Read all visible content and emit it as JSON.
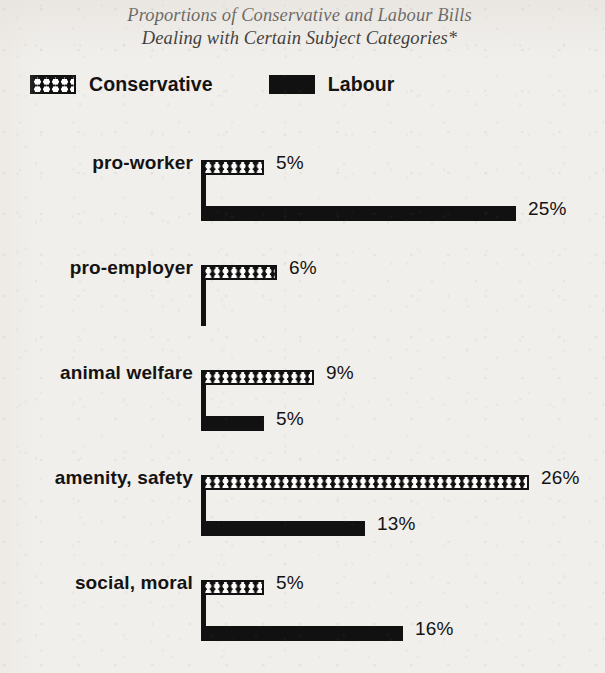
{
  "title": {
    "line1": "Proportions of Conservative and Labour Bills",
    "line2": "Dealing with Certain Subject Categories*"
  },
  "legend": {
    "conservative": "Conservative",
    "labour": "Labour"
  },
  "chart_data": {
    "type": "bar",
    "orientation": "horizontal",
    "title": "Proportions of Conservative and Labour Bills Dealing with Certain Subject Categories*",
    "xlabel": "",
    "ylabel": "",
    "xlim": [
      0,
      26
    ],
    "grid": false,
    "legend_position": "top-left",
    "value_suffix": "%",
    "categories": [
      "pro-worker",
      "pro-employer",
      "animal welfare",
      "amenity, safety",
      "social, moral"
    ],
    "series": [
      {
        "name": "Conservative",
        "color": "#111111",
        "pattern": "checkerboard",
        "values": [
          5,
          6,
          9,
          26,
          5
        ],
        "labels": [
          "5%",
          "6%",
          "9%",
          "26%",
          "5%"
        ]
      },
      {
        "name": "Labour",
        "color": "#111111",
        "pattern": "solid",
        "values": [
          25,
          0,
          5,
          13,
          16
        ],
        "labels": [
          "25%",
          "",
          "5%",
          "13%",
          "16%"
        ]
      }
    ]
  },
  "rows": [
    {
      "label": "pro-worker",
      "conservative": {
        "value": 5,
        "label": "5%"
      },
      "labour": {
        "value": 25,
        "label": "25%"
      }
    },
    {
      "label": "pro-employer",
      "conservative": {
        "value": 6,
        "label": "6%"
      },
      "labour": {
        "value": 0,
        "label": ""
      }
    },
    {
      "label": "animal welfare",
      "conservative": {
        "value": 9,
        "label": "9%"
      },
      "labour": {
        "value": 5,
        "label": "5%"
      }
    },
    {
      "label": "amenity, safety",
      "conservative": {
        "value": 26,
        "label": "26%"
      },
      "labour": {
        "value": 13,
        "label": "13%"
      }
    },
    {
      "label": "social, moral",
      "conservative": {
        "value": 5,
        "label": "5%"
      },
      "labour": {
        "value": 16,
        "label": "16%"
      }
    }
  ],
  "geometry": {
    "origin_x": 201,
    "px_per_percent": 12.6,
    "row_tops": [
      160,
      265,
      370,
      475,
      580
    ],
    "bar_height": 15,
    "labour_offset": 46,
    "label_gap": 12
  }
}
